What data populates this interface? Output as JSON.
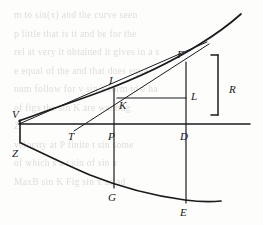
{
  "figure": {
    "ink_color": "#1b1b1e",
    "paper_color": "#fdfdfc",
    "ghost_color": "#d9d7d2",
    "bracket_label": "R",
    "points": [
      {
        "id": "V",
        "label": "V",
        "x": 19,
        "y": 120,
        "lx": 13,
        "ly": 118
      },
      {
        "id": "Z",
        "label": "Z",
        "x": 21,
        "y": 143,
        "lx": 13,
        "ly": 155
      },
      {
        "id": "T",
        "label": "T",
        "x": 74,
        "y": 131,
        "lx": 69,
        "ly": 139
      },
      {
        "id": "P",
        "label": "P",
        "x": 114,
        "y": 131,
        "lx": 108,
        "ly": 139
      },
      {
        "id": "D",
        "label": "D",
        "x": 186,
        "y": 131,
        "lx": 181,
        "ly": 139
      },
      {
        "id": "I",
        "label": "I",
        "x": 114,
        "y": 88,
        "lx": 108,
        "ly": 84
      },
      {
        "id": "K",
        "label": "K",
        "x": 119,
        "y": 101,
        "lx": 117,
        "ly": 106
      },
      {
        "id": "L",
        "label": "L",
        "x": 186,
        "y": 96,
        "lx": 191,
        "ly": 98
      },
      {
        "id": "F",
        "label": "F",
        "x": 186,
        "y": 62,
        "lx": 178,
        "ly": 57
      },
      {
        "id": "G",
        "label": "G",
        "x": 114,
        "y": 188,
        "lx": 108,
        "ly": 199
      },
      {
        "id": "E",
        "label": "E",
        "x": 186,
        "y": 203,
        "lx": 180,
        "ly": 214
      }
    ],
    "axis": {
      "from_x": 19,
      "to_x": 250,
      "y": 124
    },
    "upper_curve": "M 19 121 C 40 113, 70 103, 100 92 C 135 79, 170 63, 200 44 C 218 33, 232 22, 241 14",
    "lower_curve": "M 21 143 C 40 152, 62 163, 90 175 C 120 187, 155 196, 185 200 C 200 202, 212 202, 221 201",
    "vertex_segment": {
      "x": 20,
      "y1": 120,
      "y2": 143
    },
    "tangent_line": {
      "x1": 74,
      "y1": 131,
      "x2": 209,
      "y2": 44
    },
    "chord_line": {
      "x1": 19,
      "y1": 124,
      "x2": 207,
      "y2": 42
    },
    "verticals": [
      {
        "name": "vertical-through-P",
        "x": 114,
        "y1": 88,
        "y2": 188
      },
      {
        "name": "vertical-through-D",
        "x": 186,
        "y1": 62,
        "y2": 203
      }
    ],
    "horizontal_kl": {
      "x1": 117,
      "y1": 98,
      "x2": 186,
      "y2": 98
    },
    "bracket": {
      "x": 218,
      "y_top": 55,
      "y_bottom": 115,
      "arm": 7,
      "label_x": 231,
      "label_y": 89
    }
  },
  "ghost_text_lines": [
    "   m  to  sin(x)  and  the curve  seen",
    "p        little  that  is   it  and  be  for  the",
    "",
    "rel  at  very  it  obtained  it  gives  in  a  s",
    "e  equal  of  the  and  that  does  equa",
    "num  follow  for  v  sin  a  form  to  e  ha",
    "",
    "  of  figs  the  sin  K  are   wanting",
    "    Z",
    "  velocity  at  P  finite  t  sin    some",
    "  of  which    s  a  t  sin  of  sin  a",
    "  MaxB  sin  K  Fig  sin  x  as    ad"
  ]
}
